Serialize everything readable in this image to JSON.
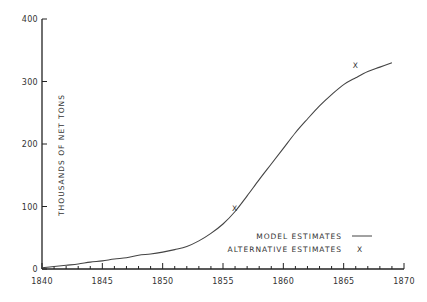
{
  "chart_data": {
    "type": "line",
    "title": "",
    "xlabel": "",
    "ylabel": "THOUSANDS OF NET TONS",
    "xlim": [
      1840,
      1870
    ],
    "ylim": [
      0,
      400
    ],
    "x_ticks": [
      1840,
      1845,
      1850,
      1855,
      1860,
      1865,
      1870
    ],
    "y_ticks": [
      0,
      100,
      200,
      300,
      400
    ],
    "grid": false,
    "legend_position": "lower right",
    "series": [
      {
        "name": "MODEL ESTIMATES",
        "style": "line",
        "x": [
          1840,
          1841,
          1842,
          1843,
          1844,
          1845,
          1846,
          1847,
          1848,
          1849,
          1850,
          1851,
          1852,
          1853,
          1854,
          1855,
          1856,
          1857,
          1858,
          1859,
          1860,
          1861,
          1862,
          1863,
          1864,
          1865,
          1866,
          1867,
          1868,
          1869
        ],
        "y": [
          2,
          4,
          6,
          8,
          11,
          13,
          16,
          18,
          22,
          24,
          27,
          31,
          36,
          45,
          57,
          72,
          92,
          117,
          143,
          168,
          193,
          218,
          240,
          261,
          279,
          295,
          306,
          316,
          323,
          330
        ]
      },
      {
        "name": "ALTERNATIVE ESTIMATES",
        "style": "marker-x",
        "x": [
          1856,
          1866
        ],
        "y": [
          97,
          327
        ]
      }
    ]
  },
  "legend": {
    "model_label": "MODEL ESTIMATES",
    "alternative_label": "ALTERNATIVE ESTIMATES",
    "alternative_marker": "X"
  },
  "axes": {
    "y_title": "THOUSANDS OF NET TONS",
    "x_tick_labels": [
      "1840",
      "1845",
      "1850",
      "1855",
      "1860",
      "1865",
      "1870"
    ],
    "y_tick_labels": [
      "0",
      "100",
      "200",
      "300",
      "400"
    ]
  },
  "colors": {
    "axis": "#222222",
    "line": "#444444",
    "text": "#333333"
  }
}
